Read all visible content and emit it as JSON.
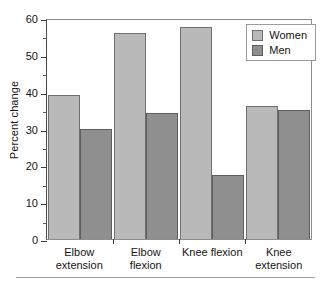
{
  "chart_data": {
    "type": "bar",
    "title": "",
    "xlabel": "",
    "ylabel": "Percent change",
    "ylim": [
      0,
      60
    ],
    "ytick_labels": [
      "0",
      "10",
      "20",
      "30",
      "40",
      "50",
      "60"
    ],
    "ytick_values": [
      0,
      10,
      20,
      30,
      40,
      50,
      60
    ],
    "yminor_step": 5,
    "grid": false,
    "legend_position": "top-right",
    "categories": [
      "Elbow extension",
      "Elbow flexion",
      "Knee flexion",
      "Knee extension"
    ],
    "category_lines": [
      [
        "Elbow",
        "extension"
      ],
      [
        "Elbow",
        "flexion"
      ],
      [
        "Knee flexion",
        ""
      ],
      [
        "Knee",
        "extension"
      ]
    ],
    "series": [
      {
        "name": "Women",
        "color": "#b9b9b9",
        "values": [
          39,
          56,
          57.5,
          36
        ]
      },
      {
        "name": "Men",
        "color": "#8f8f8f",
        "values": [
          30,
          34.3,
          17.5,
          35
        ]
      }
    ]
  }
}
